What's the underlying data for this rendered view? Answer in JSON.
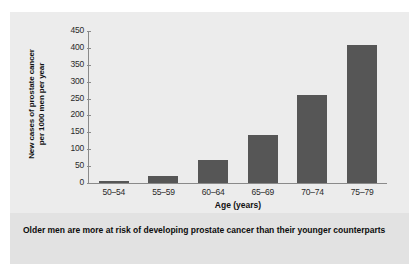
{
  "chart_data": {
    "type": "bar",
    "title": "",
    "categories": [
      "50–54",
      "55–59",
      "60–64",
      "65–69",
      "70–74",
      "75–79"
    ],
    "values": [
      5,
      22,
      68,
      142,
      260,
      408
    ],
    "series": [
      {
        "name": "New cases of prostate cancer per 1000 men per year",
        "values": [
          5,
          22,
          68,
          142,
          260,
          408
        ]
      }
    ],
    "xlabel": "Age (years)",
    "ylabel_line1": "New cases of prostate cancer",
    "ylabel_line2": "per 1000 men per year",
    "ylabel": "New cases of prostate cancer per 1000 men per year",
    "ylim": [
      0,
      450
    ],
    "yticks": [
      0,
      50,
      100,
      150,
      200,
      250,
      300,
      350,
      400,
      450
    ],
    "ytick_labels": [
      "0",
      "50",
      "100",
      "150",
      "200",
      "250",
      "300",
      "350",
      "400",
      "450"
    ],
    "grid": false,
    "legend": null,
    "bar_color": "#565656",
    "axis_color": "#8a8a8a",
    "plot_background": "#ececec"
  },
  "figure": {
    "background": "#e9e9e9",
    "caption": "Older men are more at risk of developing prostate cancer than their younger counterparts",
    "caption_background": "#e2e2e2"
  }
}
